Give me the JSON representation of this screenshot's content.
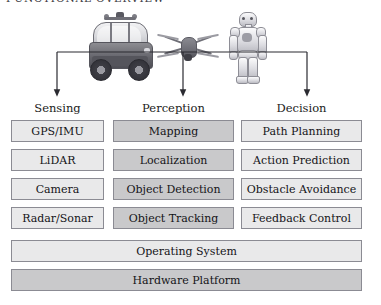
{
  "title": "FUNCTIONAL OVERVIEW",
  "diagram": {
    "type": "layered-block-diagram",
    "platform_images": [
      {
        "name": "autonomous-car",
        "label": "Autonomous Vehicle"
      },
      {
        "name": "quadcopter-drone",
        "label": "Quadcopter Drone"
      },
      {
        "name": "humanoid-robot",
        "label": "Humanoid Robot"
      }
    ],
    "columns": [
      {
        "header": "Sensing",
        "fill": "light",
        "items": [
          "GPS/IMU",
          "LiDAR",
          "Camera",
          "Radar/Sonar"
        ]
      },
      {
        "header": "Perception",
        "fill": "dark",
        "items": [
          "Mapping",
          "Localization",
          "Object Detection",
          "Object Tracking"
        ]
      },
      {
        "header": "Decision",
        "fill": "light",
        "items": [
          "Path Planning",
          "Action Prediction",
          "Obstacle Avoidance",
          "Feedback Control"
        ]
      }
    ],
    "base_layers": [
      {
        "label": "Operating System",
        "fill": "light"
      },
      {
        "label": "Hardware Platform",
        "fill": "dark"
      }
    ]
  },
  "colors": {
    "box_light": "#e9e9ea",
    "box_dark": "#c9c9cb",
    "box_border": "#8b8b93",
    "text": "#141418",
    "connector": "#2b2b31",
    "background": "#ffffff"
  }
}
